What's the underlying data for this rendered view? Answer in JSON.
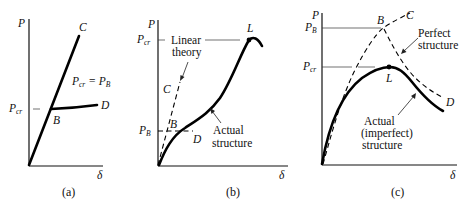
{
  "figure": {
    "panels": [
      {
        "id": "a",
        "caption": "(a)",
        "y_axis_label": "P",
        "x_axis_label": "δ",
        "tick_labels": {
          "pcr_main": "P",
          "pcr_sub": "cr"
        },
        "points": {
          "C": "C",
          "B": "B",
          "D": "D"
        },
        "equation": {
          "p1": "P",
          "s1": "cr",
          "eq": " = P",
          "s2": "B"
        }
      },
      {
        "id": "b",
        "caption": "(b)",
        "y_axis_label": "P",
        "x_axis_label": "δ",
        "tick_labels": {
          "pcr_main": "P",
          "pcr_sub": "cr",
          "pb_main": "P",
          "pb_sub": "B"
        },
        "points": {
          "L": "L",
          "C": "C",
          "B": "B",
          "D": "D"
        },
        "annotations": {
          "linear_line1": "Linear",
          "linear_line2": "theory",
          "actual_line1": "Actual",
          "actual_line2": "structure"
        }
      },
      {
        "id": "c",
        "caption": "(c)",
        "y_axis_label": "P",
        "x_axis_label": "δ",
        "tick_labels": {
          "pb_main": "P",
          "pb_sub": "B",
          "pcr_main": "P",
          "pcr_sub": "cr"
        },
        "points": {
          "B": "B",
          "C": "C",
          "L": "L",
          "D": "D"
        },
        "annotations": {
          "perfect_line1": "Perfect",
          "perfect_line2": "structure",
          "actual_line1": "Actual",
          "actual_line2": "(imperfect)",
          "actual_line3": "structure"
        }
      }
    ]
  }
}
